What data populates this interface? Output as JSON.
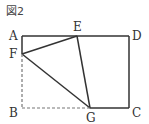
{
  "figure": {
    "title": "図2",
    "points": {
      "A": "A",
      "B": "B",
      "C": "C",
      "D": "D",
      "E": "E",
      "F": "F",
      "G": "G"
    },
    "solid_segments": [
      [
        "A",
        "D"
      ],
      [
        "D",
        "C"
      ],
      [
        "C",
        "G"
      ],
      [
        "A",
        "F"
      ],
      [
        "F",
        "E"
      ],
      [
        "E",
        "G"
      ],
      [
        "F",
        "G"
      ]
    ],
    "dashed_segments": [
      [
        "F",
        "B"
      ],
      [
        "B",
        "G"
      ]
    ],
    "colors": {
      "line": "#333333",
      "dashed": "#666666"
    }
  }
}
